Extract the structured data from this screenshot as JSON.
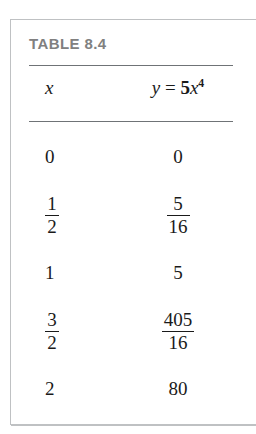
{
  "figure": {
    "title": "TABLE 8.4",
    "title_color": "#808080",
    "border_color": "#bfc1c3",
    "rule_color": "#6f7376",
    "text_color": "#1a1a1a"
  },
  "table": {
    "columns": [
      {
        "id": "x",
        "label": "x",
        "style": "italic"
      },
      {
        "id": "y",
        "label": "y = 5x^4",
        "style": "italic-with-superscript",
        "parts": {
          "variable": "y",
          "equals": "=",
          "coefficient": "5",
          "base": "x",
          "exponent": "4"
        }
      }
    ],
    "rows": [
      {
        "x": {
          "display": "0",
          "kind": "integer",
          "value": "0"
        },
        "y": {
          "display": "0",
          "kind": "integer",
          "value": "0"
        }
      },
      {
        "x": {
          "display": "1/2",
          "kind": "fraction",
          "numerator": "1",
          "denominator": "2"
        },
        "y": {
          "display": "5/16",
          "kind": "fraction",
          "numerator": "5",
          "denominator": "16"
        }
      },
      {
        "x": {
          "display": "1",
          "kind": "integer",
          "value": "1"
        },
        "y": {
          "display": "5",
          "kind": "integer",
          "value": "5"
        }
      },
      {
        "x": {
          "display": "3/2",
          "kind": "fraction",
          "numerator": "3",
          "denominator": "2"
        },
        "y": {
          "display": "405/16",
          "kind": "fraction",
          "numerator": "405",
          "denominator": "16"
        }
      },
      {
        "x": {
          "display": "2",
          "kind": "integer",
          "value": "2"
        },
        "y": {
          "display": "80",
          "kind": "integer",
          "value": "80"
        }
      }
    ]
  },
  "chart_data": {
    "type": "table",
    "title": "TABLE 8.4",
    "columns": [
      "x",
      "y = 5x⁴"
    ],
    "rows": [
      [
        "0",
        "0"
      ],
      [
        "1/2",
        "5/16"
      ],
      [
        "1",
        "5"
      ],
      [
        "3/2",
        "405/16"
      ],
      [
        "2",
        "80"
      ]
    ],
    "x": [
      0,
      0.5,
      1,
      1.5,
      2
    ],
    "y": [
      0,
      0.3125,
      5,
      25.3125,
      80
    ],
    "xlabel": "x",
    "ylabel": "y = 5x^4",
    "grid": false
  }
}
